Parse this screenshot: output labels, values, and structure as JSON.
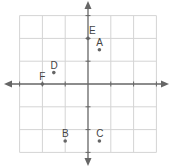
{
  "chart_data": {
    "type": "scatter",
    "title": "",
    "xlabel": "",
    "ylabel": "",
    "xlim": [
      -3,
      3
    ],
    "ylim": [
      -3,
      3
    ],
    "grid": true,
    "axes_arrows": true,
    "tick_labels": false,
    "points": [
      {
        "label": "A",
        "x": 0.5,
        "y": 1.5
      },
      {
        "label": "B",
        "x": -1,
        "y": -2.5
      },
      {
        "label": "C",
        "x": 0.5,
        "y": -2.5
      },
      {
        "label": "D",
        "x": -1.5,
        "y": 0.5
      },
      {
        "label": "E",
        "x": 0,
        "y": 2
      },
      {
        "label": "F",
        "x": -2,
        "y": 0
      }
    ]
  },
  "style": {
    "grid_color": "#d4d4d4",
    "axis_color": "#666666",
    "point_color": "#666666",
    "label_color": "#444444"
  }
}
